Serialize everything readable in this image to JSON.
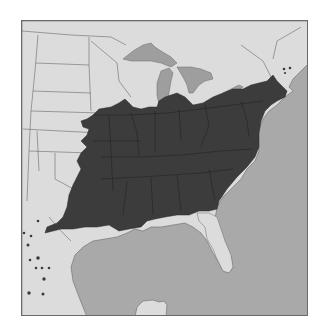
{
  "map": {
    "type": "species-range-map",
    "region": "Eastern United States",
    "colors": {
      "background": "#ffffff",
      "land": "#dcdcdc",
      "water": "#a9a9a9",
      "great_lakes": "#9e9e9e",
      "range": "#3c3c3c",
      "borders": "#5a5a5a",
      "dots": "#3a3a3a",
      "frame": "#6a6a6a"
    },
    "range_description": "Dark shaded continuous range across eastern US from Iowa/Missouri east to the Atlantic coast and south to the Gulf coast, excluding peninsular Florida",
    "disjunct_dots": [
      {
        "x": 23,
        "y": 232
      },
      {
        "x": 30,
        "y": 235
      },
      {
        "x": 37,
        "y": 220
      },
      {
        "x": 27,
        "y": 244
      },
      {
        "x": 29,
        "y": 259
      },
      {
        "x": 37,
        "y": 257
      },
      {
        "x": 35,
        "y": 267
      },
      {
        "x": 41,
        "y": 267
      },
      {
        "x": 48,
        "y": 267
      },
      {
        "x": 43,
        "y": 278
      },
      {
        "x": 28,
        "y": 292
      },
      {
        "x": 42,
        "y": 293
      },
      {
        "x": 283,
        "y": 68
      },
      {
        "x": 289,
        "y": 67
      },
      {
        "x": 284,
        "y": 72
      }
    ]
  }
}
